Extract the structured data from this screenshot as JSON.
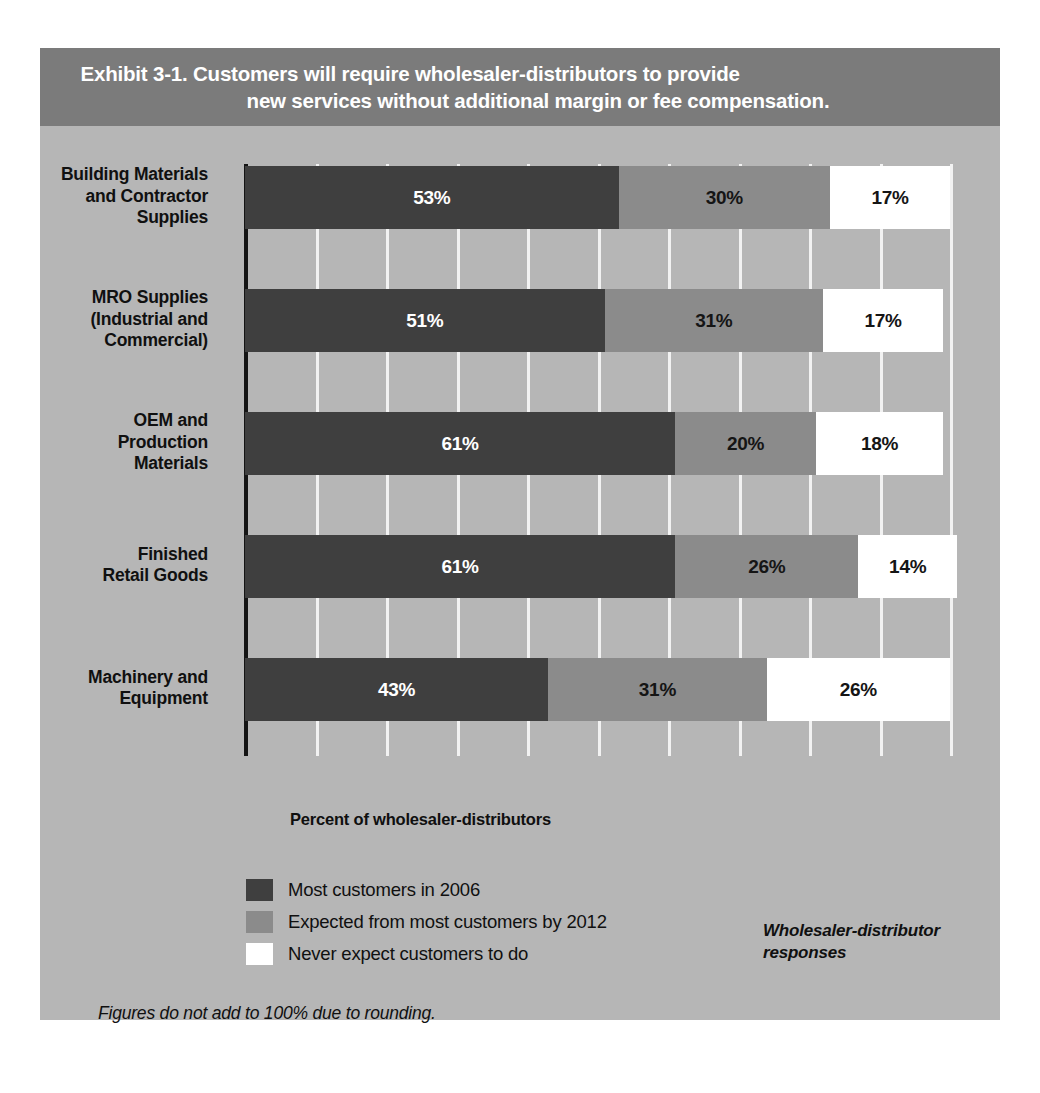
{
  "exhibit": {
    "title_line1": "Exhibit 3-1. Customers will require wholesaler-distributors to provide",
    "title_line2": "new services without additional margin or fee compensation."
  },
  "axis_title": "Percent of wholesaler-distributors",
  "response_note_line1": "Wholesaler-distributor",
  "response_note_line2": "responses",
  "footnote": "Figures do not add to 100% due to rounding.",
  "legend": [
    {
      "label": "Most customers in 2006",
      "color": "#3f3f3f"
    },
    {
      "label": "Expected from most customers by 2012",
      "color": "#8b8b8b"
    },
    {
      "label": "Never expect customers to do",
      "color": "#ffffff"
    }
  ],
  "colors": {
    "panel_background": "#b6b6b6",
    "title_band": "#7b7b7b",
    "title_text": "#ffffff",
    "series_1": "#3f3f3f",
    "series_2": "#8b8b8b",
    "series_3": "#ffffff",
    "axis": "#141414",
    "gridline": "#f2f2f2"
  },
  "chart_data": {
    "type": "bar",
    "orientation": "horizontal",
    "stacked": true,
    "title": "Exhibit 3-1. Customers will require wholesaler-distributors to provide new services without additional margin or fee compensation.",
    "xlabel": "Percent of wholesaler-distributors",
    "ylabel": "",
    "xlim": [
      0,
      100
    ],
    "xticks": [
      0,
      10,
      20,
      30,
      40,
      50,
      60,
      70,
      80,
      90,
      100
    ],
    "grid": true,
    "legend_position": "bottom-left",
    "categories": [
      "Building Materials and Contractor Supplies",
      "MRO Supplies (Industrial and Commercial)",
      "OEM and Production Materials",
      "Finished Retail Goods",
      "Machinery and Equipment"
    ],
    "category_lines": [
      [
        "Building Materials",
        "and Contractor",
        "Supplies"
      ],
      [
        "MRO Supplies",
        "(Industrial and",
        "Commercial)"
      ],
      [
        "OEM and",
        "Production",
        "Materials"
      ],
      [
        "Finished",
        "Retail Goods"
      ],
      [
        "Machinery and",
        "Equipment"
      ]
    ],
    "series": [
      {
        "name": "Most customers in 2006",
        "values": [
          53,
          51,
          61,
          61,
          43
        ]
      },
      {
        "name": "Expected from most customers by 2012",
        "values": [
          30,
          31,
          20,
          26,
          31
        ]
      },
      {
        "name": "Never expect customers to do",
        "values": [
          17,
          17,
          18,
          14,
          26
        ]
      }
    ],
    "data_labels": [
      [
        "53%",
        "30%",
        "17%"
      ],
      [
        "51%",
        "31%",
        "17%"
      ],
      [
        "61%",
        "20%",
        "18%"
      ],
      [
        "61%",
        "26%",
        "14%"
      ],
      [
        "43%",
        "31%",
        "26%"
      ]
    ],
    "note": "Figures do not add to 100% due to rounding."
  }
}
